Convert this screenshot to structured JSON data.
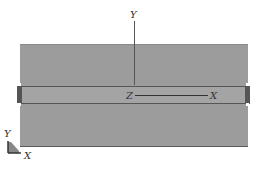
{
  "diagram": {
    "axes_labels": {
      "y_top": "Y",
      "z_origin": "Z",
      "x_end": "X"
    },
    "triad": {
      "y_label": "Y",
      "x_label": "X"
    },
    "colors": {
      "body": "#9c9c9c",
      "band": "#a4a4a4",
      "edge": "#555555"
    }
  }
}
